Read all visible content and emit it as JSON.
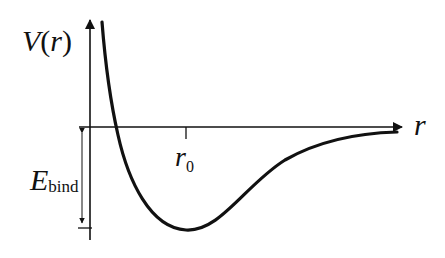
{
  "diagram": {
    "y_axis": {
      "label_main": "V",
      "label_paren_open": "(",
      "label_var": "r",
      "label_paren_close": ")"
    },
    "x_axis": {
      "label": "r"
    },
    "equilibrium": {
      "label_main": "r",
      "label_sub": "0"
    },
    "binding_energy": {
      "label_main": "E",
      "label_sub": "bind"
    },
    "colors": {
      "stroke": "#111111",
      "background": "#ffffff"
    }
  }
}
